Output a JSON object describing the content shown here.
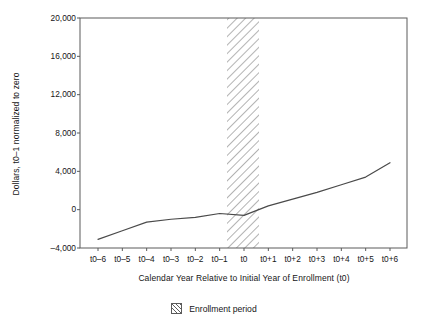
{
  "chart_data": {
    "type": "line",
    "title": "",
    "xlabel": "Calendar Year Relative to Initial Year of Enrollment (t0)",
    "ylabel": "Dollars, t0–1 normalized to zero",
    "categories": [
      "t0–6",
      "t0–5",
      "t0–4",
      "t0–3",
      "t0–2",
      "t0–1",
      "t0",
      "t0+1",
      "t0+2",
      "t0+3",
      "t0+4",
      "t0+5",
      "t0+6"
    ],
    "values": [
      -3100,
      -2200,
      -1300,
      -1000,
      -800,
      -400,
      -600,
      400,
      1100,
      1800,
      2600,
      3400,
      4900
    ],
    "series": [
      {
        "name": "Dollars",
        "values": [
          -3100,
          -2200,
          -1300,
          -1000,
          -800,
          -400,
          -600,
          400,
          1100,
          1800,
          2600,
          3400,
          4900
        ]
      }
    ],
    "ylim": [
      -4000,
      20000
    ],
    "yticks": [
      -4000,
      0,
      4000,
      8000,
      12000,
      16000,
      20000
    ],
    "ytick_labels": [
      "–4,000",
      "0",
      "4,000",
      "8,000",
      "12,000",
      "16,000",
      "20,000"
    ],
    "xtick_labels": [
      "t0–6",
      "t0–5",
      "t0–4",
      "t0–3",
      "t0–2",
      "t0–1",
      "t0",
      "t0+1",
      "t0+2",
      "t0+3",
      "t0+4",
      "t0+5",
      "t0+6"
    ],
    "grid": false,
    "legend_position": "bottom-center",
    "annotations": [
      {
        "type": "shaded-band",
        "label": "Enrollment period",
        "x_start": "t0–1",
        "x_end": "t0",
        "fill": "diagonal-hatch"
      }
    ],
    "line_color": "#4a4a4a",
    "axis_color": "#5b5b5b",
    "hatch_color": "#9a9a9a"
  },
  "legend": {
    "items": [
      {
        "label": "Enrollment period",
        "swatch": "hatch-swatch-icon"
      }
    ]
  }
}
